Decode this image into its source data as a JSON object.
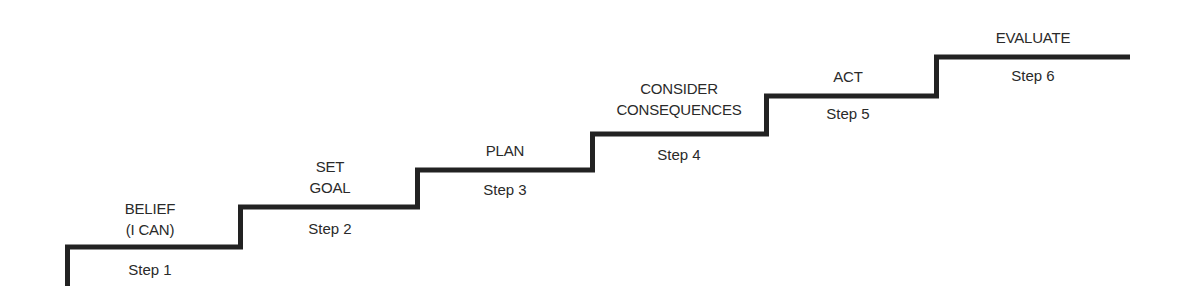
{
  "diagram": {
    "type": "staircase",
    "line_color": "#222222",
    "steps": [
      {
        "label_lines": [
          "BELIEF",
          "(I CAN)"
        ],
        "step": "Step 1"
      },
      {
        "label_lines": [
          "SET",
          "GOAL"
        ],
        "step": "Step 2"
      },
      {
        "label_lines": [
          "PLAN"
        ],
        "step": "Step 3"
      },
      {
        "label_lines": [
          "CONSIDER",
          "CONSEQUENCES"
        ],
        "step": "Step 4"
      },
      {
        "label_lines": [
          "ACT"
        ],
        "step": "Step 5"
      },
      {
        "label_lines": [
          "EVALUATE"
        ],
        "step": "Step 6"
      }
    ]
  }
}
